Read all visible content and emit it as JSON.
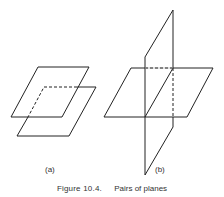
{
  "figure": {
    "number": "Figure 10.4.",
    "title": "Pairs of planes",
    "panels": [
      {
        "label": "(a)",
        "description": "Two parallel planes"
      },
      {
        "label": "(b)",
        "description": "Two intersecting planes"
      }
    ],
    "line_color": "#222222"
  }
}
